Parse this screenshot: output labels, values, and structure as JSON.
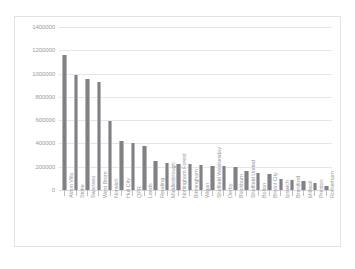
{
  "top_strip": {
    "ghost_text": "·          ·        ·                    ·  ·            ·"
  },
  "chart_data": {
    "type": "bar",
    "title": "",
    "subtitle": "",
    "xlabel": "",
    "ylabel": "",
    "ylim": [
      0,
      1400000
    ],
    "ytick_values": [
      1400000,
      1200000,
      1000000,
      800000,
      600000,
      400000,
      200000,
      0
    ],
    "ytick_labels": [
      "1400000",
      "1200000",
      "1000000",
      "800000",
      "600000",
      "400000",
      "200000",
      "0"
    ],
    "grid": true,
    "legend": "none",
    "bar_color": "#808085",
    "gridline_color": "#e6e6e9",
    "categories": [
      "Aston Villa",
      "Stoke",
      "Swansea",
      "West Brom",
      "Norwich",
      "Hull City",
      "QPR",
      "Leeds",
      "Reading",
      "Middlesbrough",
      "Nottingham Forest",
      "Birmingham",
      "Wigan",
      "Sheffield Wednesday",
      "Derby",
      "Blackburn",
      "Sheffield United",
      "Bolton",
      "Bristol City",
      "Ipswich",
      "Brentford",
      "Millwall",
      "Preston",
      "Rotherham"
    ],
    "values": [
      1160000,
      985000,
      950000,
      925000,
      590000,
      425000,
      400000,
      380000,
      250000,
      235000,
      225000,
      220000,
      215000,
      210000,
      205000,
      200000,
      165000,
      145000,
      140000,
      95000,
      90000,
      80000,
      60000,
      35000
    ]
  }
}
